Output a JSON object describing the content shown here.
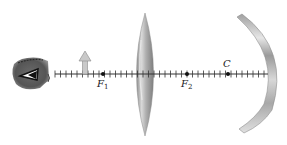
{
  "diagram": {
    "type": "optics-ray-setup",
    "colors": {
      "background": "#ffffff",
      "axis": "#333333",
      "lens": "#a8a8a8",
      "mirror": "#b5b5b5",
      "eye": "#6e6e6e",
      "object_arrow": "#c4c4c4"
    },
    "axis": {
      "x_start": 55,
      "x_end": 268,
      "y": 74,
      "tick_spacing": 5.5
    },
    "elements": {
      "eye": {
        "label": ""
      },
      "object": {
        "label": "",
        "x": 85
      },
      "lens": {
        "label": "",
        "x": 145
      },
      "mirror": {
        "label": "",
        "x": 268
      }
    },
    "points": [
      {
        "id": "F1",
        "symbol": "F",
        "subscript": "1",
        "x": 103
      },
      {
        "id": "F2",
        "symbol": "F",
        "subscript": "2",
        "x": 187
      },
      {
        "id": "C",
        "symbol": "C",
        "subscript": "",
        "x": 228
      }
    ]
  }
}
